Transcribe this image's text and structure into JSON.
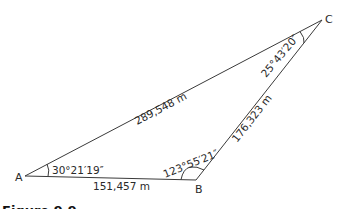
{
  "diagram": {
    "type": "triangle",
    "vertices": {
      "A": {
        "label": "A",
        "angle": "30°21′19″"
      },
      "B": {
        "label": "B",
        "angle": "123°55′21″"
      },
      "C": {
        "label": "C",
        "angle": "25°43′20″"
      }
    },
    "sides": {
      "AB": "151,457 m",
      "BC": "176,323 m",
      "AC": "289,548 m"
    },
    "caption": "Figure 9.9",
    "line_color": "#3a3a3a",
    "text_color": "#2a2a2a"
  }
}
